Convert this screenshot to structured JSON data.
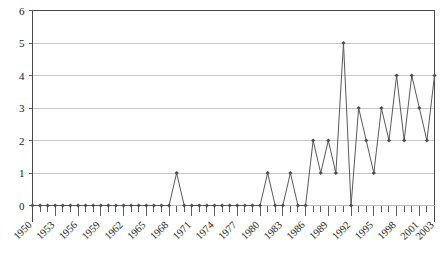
{
  "chart_data": {
    "type": "line",
    "title": "",
    "subtitle": "",
    "xlabel": "",
    "ylabel": "",
    "x": [
      1950,
      1951,
      1952,
      1953,
      1954,
      1955,
      1956,
      1957,
      1958,
      1959,
      1960,
      1961,
      1962,
      1963,
      1964,
      1965,
      1966,
      1967,
      1968,
      1969,
      1970,
      1971,
      1972,
      1973,
      1974,
      1975,
      1976,
      1977,
      1978,
      1979,
      1980,
      1981,
      1982,
      1983,
      1984,
      1985,
      1986,
      1987,
      1988,
      1989,
      1990,
      1991,
      1992,
      1993,
      1994,
      1995,
      1996,
      1997,
      1998,
      1999,
      2000,
      2001,
      2002,
      2003
    ],
    "values": [
      0,
      0,
      0,
      0,
      0,
      0,
      0,
      0,
      0,
      0,
      0,
      0,
      0,
      0,
      0,
      0,
      0,
      0,
      0,
      1,
      0,
      0,
      0,
      0,
      0,
      0,
      0,
      0,
      0,
      0,
      0,
      1,
      0,
      0,
      1,
      0,
      0,
      2,
      1,
      2,
      1,
      5,
      0,
      3,
      2,
      1,
      3,
      2,
      4,
      2,
      4,
      3,
      2,
      4
    ],
    "series": [
      {
        "name": "count",
        "values": [
          0,
          0,
          0,
          0,
          0,
          0,
          0,
          0,
          0,
          0,
          0,
          0,
          0,
          0,
          0,
          0,
          0,
          0,
          0,
          1,
          0,
          0,
          0,
          0,
          0,
          0,
          0,
          0,
          0,
          0,
          0,
          1,
          0,
          0,
          1,
          0,
          0,
          2,
          1,
          2,
          1,
          5,
          0,
          3,
          2,
          1,
          3,
          2,
          4,
          2,
          4,
          3,
          2,
          4
        ]
      }
    ],
    "xlim": [
      1950,
      2003
    ],
    "ylim": [
      0,
      6
    ],
    "ytick_labels": [
      "0",
      "1",
      "2",
      "3",
      "4",
      "5",
      "6"
    ],
    "yticks": [
      0,
      1,
      2,
      3,
      4,
      5,
      6
    ],
    "xtick_labels": [
      "1950",
      "1953",
      "1956",
      "1959",
      "1962",
      "1965",
      "1968",
      "1971",
      "1974",
      "1977",
      "1980",
      "1983",
      "1986",
      "1989",
      "1992",
      "1995",
      "1998",
      "2001",
      "2003"
    ],
    "xticks": [
      1950,
      1953,
      1956,
      1959,
      1962,
      1965,
      1968,
      1971,
      1974,
      1977,
      1980,
      1983,
      1986,
      1989,
      1992,
      1995,
      1998,
      2001,
      2003
    ],
    "xtick_label_rotation": -45,
    "grid": "horizontal",
    "legend": "none",
    "marker": "diamond",
    "colors": {
      "line": "#595959",
      "marker": "#4d4d4d",
      "grid": "#b9b9b9",
      "axis": "#4a4a4a",
      "background": "#ffffff",
      "text": "#1a1a1a"
    }
  }
}
